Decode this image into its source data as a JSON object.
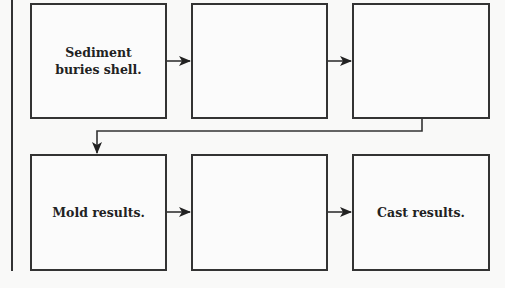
{
  "diagram": {
    "type": "flowchart",
    "rows": [
      {
        "boxes": [
          {
            "id": "r1b1",
            "label": "Sediment\nburies shell.",
            "line1": "Sediment",
            "line2": "buries shell."
          },
          {
            "id": "r1b2",
            "label": ""
          },
          {
            "id": "r1b3",
            "label": ""
          }
        ]
      },
      {
        "boxes": [
          {
            "id": "r2b1",
            "label": "Mold results."
          },
          {
            "id": "r2b2",
            "label": ""
          },
          {
            "id": "r2b3",
            "label": "Cast results."
          }
        ]
      }
    ],
    "edges": [
      {
        "from": "r1b1",
        "to": "r1b2"
      },
      {
        "from": "r1b2",
        "to": "r1b3"
      },
      {
        "from": "r1b3",
        "to": "r2b1"
      },
      {
        "from": "r2b1",
        "to": "r2b2"
      },
      {
        "from": "r2b2",
        "to": "r2b3"
      }
    ],
    "colors": {
      "stroke": "#333333",
      "text": "#222222",
      "background": "#f9f9f8"
    }
  }
}
